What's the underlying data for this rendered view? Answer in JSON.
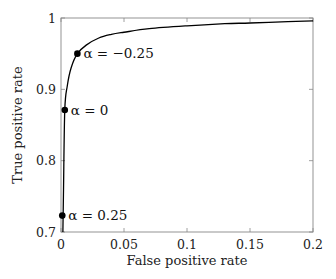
{
  "chart_data": {
    "type": "line",
    "title": "",
    "xlabel": "False positive rate",
    "ylabel": "True positive rate",
    "xlim": [
      0,
      0.2
    ],
    "ylim": [
      0.7,
      1.0
    ],
    "grid": false,
    "legend": null,
    "x_ticks": [
      0,
      0.05,
      0.1,
      0.15,
      0.2
    ],
    "x_tick_labels": [
      "0",
      "0.05",
      "0.1",
      "0.15",
      "0.2"
    ],
    "y_ticks": [
      0.7,
      0.8,
      0.9,
      1.0
    ],
    "y_tick_labels": [
      "0.7",
      "0.8",
      "0.9",
      "1"
    ],
    "series": [
      {
        "name": "ROC curve",
        "color": "#000000",
        "x": [
          0.0015,
          0.002,
          0.003,
          0.005,
          0.008,
          0.013,
          0.02,
          0.03,
          0.04,
          0.05,
          0.07,
          0.1,
          0.13,
          0.15,
          0.18,
          0.2
        ],
        "y": [
          0.7,
          0.76,
          0.871,
          0.905,
          0.93,
          0.95,
          0.962,
          0.972,
          0.977,
          0.98,
          0.985,
          0.989,
          0.992,
          0.993,
          0.995,
          0.996
        ]
      }
    ],
    "markers": [
      {
        "label": "α = 0.25",
        "x": 0.001,
        "y": 0.723
      },
      {
        "label": "α = 0",
        "x": 0.003,
        "y": 0.871
      },
      {
        "label": "α = −0.25",
        "x": 0.013,
        "y": 0.95
      }
    ]
  },
  "layout": {
    "plot_left": 61,
    "plot_right": 313,
    "plot_top": 18,
    "plot_bottom": 232,
    "axis_color": "#888888",
    "curve_color": "#000000",
    "marker_color": "#000000"
  }
}
